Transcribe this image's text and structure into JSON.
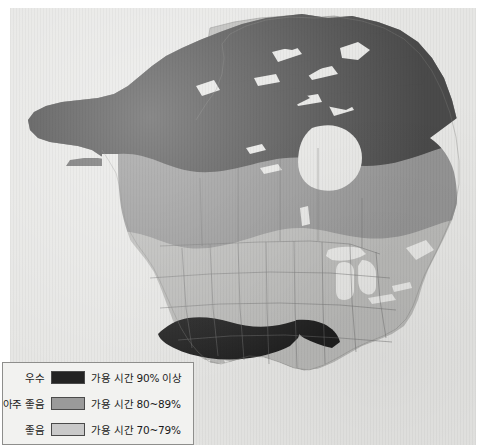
{
  "figure": {
    "kind": "availability-map",
    "region": "North America",
    "background_color": "#e8e8e6",
    "paper_color": "#ffffff"
  },
  "map": {
    "ocean_color": "#e3e3e1",
    "land_outline_color": "#6f6f6f",
    "border_line_color": "#707070",
    "lake_color": "#f0f0ee",
    "zones": [
      {
        "id": "zone-excellent",
        "grade": "우수",
        "availability": "가용 시간 90% 이상",
        "color": "#2b2b2b"
      },
      {
        "id": "zone-very-good",
        "grade": "아주 좋음",
        "availability": "가용 시간 80~89%",
        "color": "#8c8c8c"
      },
      {
        "id": "zone-good",
        "grade": "좋음",
        "availability": "가용 시간 70~79%",
        "color": "#bdbdbd"
      }
    ],
    "zone_fills": {
      "excellent_dark": "#4a4a4a",
      "very_good_mid": "#949494",
      "good_light": "#b9b9b7",
      "southwest_black": "#1f1f1f"
    }
  },
  "legend": {
    "id": "map-legend",
    "background_color": "#f2f2f0",
    "border_color": "#8e8e8c",
    "rows": [
      {
        "grade": "우수",
        "swatch_color": "#232323",
        "description": "가용 시간 90% 이상"
      },
      {
        "grade": "아주 좋음",
        "swatch_color": "#9a9a9a",
        "description": "가용 시간 80~89%"
      },
      {
        "grade": "좋음",
        "swatch_color": "#c9c9c9",
        "description": "가용 시간 70~79%"
      }
    ]
  }
}
